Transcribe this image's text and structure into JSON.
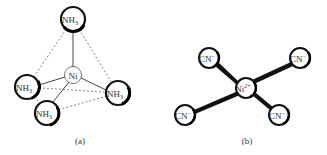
{
  "panels": [
    {
      "id": "a",
      "caption": "(a)",
      "geometry": "tetrahedral",
      "center": {
        "label": "Ni",
        "superscript": ""
      },
      "ligands": [
        {
          "label": "NH",
          "subscript": "3",
          "position": "top"
        },
        {
          "label": "NH",
          "subscript": "3",
          "position": "left"
        },
        {
          "label": "NH",
          "subscript": "3",
          "position": "right"
        },
        {
          "label": "NH",
          "subscript": "3",
          "position": "bottom"
        }
      ]
    },
    {
      "id": "b",
      "caption": "(b)",
      "geometry": "square-planar",
      "center": {
        "label": "Ni",
        "superscript": "2+"
      },
      "ligands": [
        {
          "label": "CN",
          "superscript": "−",
          "position": "top-left"
        },
        {
          "label": "CN",
          "superscript": "−",
          "position": "top-right"
        },
        {
          "label": "CN",
          "superscript": "−",
          "position": "bottom-left"
        },
        {
          "label": "CN",
          "superscript": "−",
          "position": "bottom-right"
        }
      ]
    }
  ],
  "colors": {
    "stroke": "#222222",
    "dashed": "#555555",
    "text": "#333333"
  }
}
